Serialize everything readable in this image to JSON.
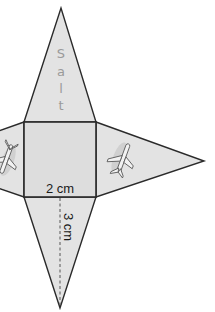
{
  "diagram": {
    "type": "square pyramid net",
    "base_label": "2 cm",
    "height_label": "3 cm",
    "top_face_text": [
      "S",
      "a",
      "l",
      "t"
    ],
    "side_face_icons": [
      "airplane-icon",
      "airplane-icon"
    ],
    "colors": {
      "fill": "#e3e3e3",
      "stroke": "#2a2a2a",
      "text_gray": "#9a9a9a",
      "background": "#ffffff"
    }
  }
}
